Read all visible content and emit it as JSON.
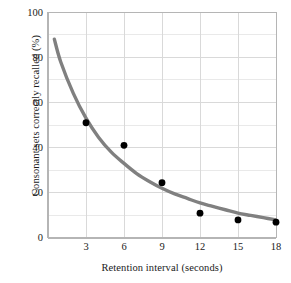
{
  "chart_data": {
    "type": "scatter",
    "title": "",
    "xlabel": "Retention interval (seconds)",
    "ylabel": "Consonant sets correctly recalled (%)",
    "xlim": [
      0,
      18
    ],
    "ylim": [
      0,
      100
    ],
    "x_ticks": [
      3,
      6,
      9,
      12,
      15,
      18
    ],
    "y_ticks": [
      0,
      20,
      40,
      60,
      80,
      100
    ],
    "y_minor_ticks": [
      10,
      30,
      50,
      70,
      90
    ],
    "grid": true,
    "legend": "none",
    "x": [
      3,
      6,
      9,
      12,
      15,
      18
    ],
    "values": [
      51,
      41,
      24.5,
      11,
      8,
      7
    ],
    "series": [
      {
        "name": "Observed recall",
        "marker": "filled-circle",
        "color": "#000000",
        "x": [
          3,
          6,
          9,
          12,
          15,
          18
        ],
        "values": [
          51,
          41,
          24.5,
          11,
          8,
          7
        ]
      },
      {
        "name": "Fitted forgetting curve",
        "marker": "none",
        "color": "#808080",
        "x": [
          0.5,
          1,
          2,
          3,
          4,
          5,
          6,
          7,
          8,
          9,
          10,
          11,
          12,
          13,
          14,
          15,
          16,
          17,
          18
        ],
        "values": [
          88,
          78,
          64,
          53,
          44.5,
          38,
          33,
          28.5,
          25,
          22,
          19.5,
          17.5,
          15.5,
          14,
          12.5,
          11,
          10,
          9,
          8
        ]
      }
    ],
    "axis_color": "#b5b5b5",
    "grid_color": "#d9d9d9",
    "background": "#ffffff"
  },
  "ticks": {
    "y": [
      "0",
      "20",
      "40",
      "60",
      "80",
      "100"
    ],
    "x": [
      "3",
      "6",
      "9",
      "12",
      "15",
      "18"
    ]
  }
}
